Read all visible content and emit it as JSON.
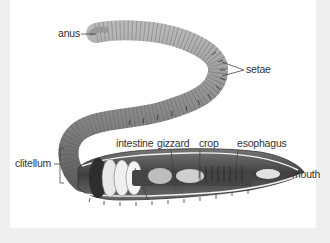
{
  "diagram": {
    "labels": {
      "anus": "anus",
      "setae": "setae",
      "clitellum": "clitellum",
      "intestine": "intestine",
      "gizzard": "gizzard",
      "crop": "crop",
      "esophagus": "esophagus",
      "mouth": "mouth"
    }
  },
  "colors": {
    "background": "#efefef",
    "panel": "#ffffff",
    "body": "#8f8f8f",
    "body_dark": "#555555",
    "label_text": "#333333",
    "leader_line": "#444444"
  }
}
